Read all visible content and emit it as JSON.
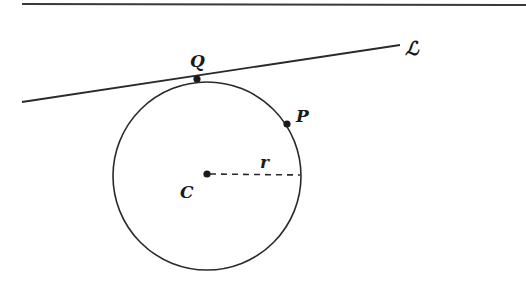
{
  "diagram": {
    "type": "geometry",
    "colors": {
      "stroke": "#2a2a2a",
      "background": "#ffffff"
    },
    "top_rule": {
      "x1": 22,
      "y1": 4,
      "x2": 526,
      "y2": 5
    },
    "circle": {
      "cx": 207,
      "cy": 176,
      "r": 94
    },
    "tangent_line": {
      "x1": 22,
      "y1": 102,
      "x2": 400,
      "y2": 45
    },
    "radius_segment": {
      "x1": 207,
      "y1": 174,
      "x2": 300,
      "y2": 175,
      "style": "dashed"
    },
    "points": [
      {
        "id": "Q",
        "x": 197,
        "y": 79
      },
      {
        "id": "P",
        "x": 287,
        "y": 124
      },
      {
        "id": "C",
        "x": 207,
        "y": 174
      }
    ],
    "labels": {
      "Q": "Q",
      "P": "P",
      "C": "C",
      "r": "r",
      "L": "ℒ"
    }
  }
}
